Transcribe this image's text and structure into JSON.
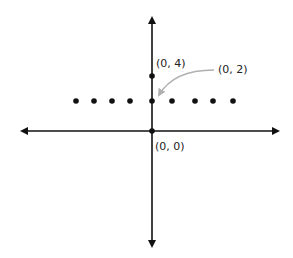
{
  "diagram": {
    "type": "coordinate-plane",
    "labels": {
      "origin": "(0, 0)",
      "point_top": "(0, 4)",
      "point_callout": "(0, 2)"
    },
    "points": [
      {
        "x": -4,
        "y": 2
      },
      {
        "x": -3,
        "y": 2
      },
      {
        "x": -2,
        "y": 2
      },
      {
        "x": -1,
        "y": 2
      },
      {
        "x": 0,
        "y": 2
      },
      {
        "x": 1,
        "y": 2
      },
      {
        "x": 2,
        "y": 2
      },
      {
        "x": 3,
        "y": 2
      },
      {
        "x": 4,
        "y": 2
      },
      {
        "x": 0,
        "y": 4
      },
      {
        "x": 0,
        "y": 0
      }
    ],
    "colors": {
      "axis": "#111111",
      "dot": "#111111",
      "callout_arrow": "#b0b0b0"
    }
  }
}
